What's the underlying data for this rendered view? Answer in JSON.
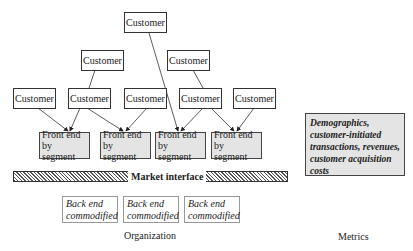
{
  "diagram": {
    "customers": [
      {
        "id": "c-top",
        "label": "Customer"
      },
      {
        "id": "c-r2-1",
        "label": "Customer"
      },
      {
        "id": "c-r2-2",
        "label": "Customer"
      },
      {
        "id": "c-r3-1",
        "label": "Customer"
      },
      {
        "id": "c-r3-2",
        "label": "Customer"
      },
      {
        "id": "c-r3-3",
        "label": "Customer"
      },
      {
        "id": "c-r3-4",
        "label": "Customer"
      },
      {
        "id": "c-r3-5",
        "label": "Customer"
      }
    ],
    "front_ends": [
      {
        "label": "Front end by segment"
      },
      {
        "label": "Front end by segment"
      },
      {
        "label": "Front end by segment"
      },
      {
        "label": "Front end by segment"
      }
    ],
    "market_interface": "Market interface",
    "back_ends": [
      {
        "label": "Back end commodified"
      },
      {
        "label": "Back end commodified"
      },
      {
        "label": "Back end commodified"
      }
    ],
    "metrics_box": "Demographics, customer-initiated transactions, revenues, customer acquisition costs",
    "organization_label": "Organization",
    "metrics_label": "Metrics"
  }
}
